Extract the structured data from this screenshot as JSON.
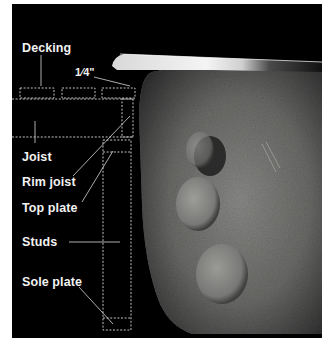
{
  "figure": {
    "type": "annotated-photo-diagram",
    "background_color": "#000000",
    "border_color": "#ffffff",
    "label_color": "#f2f2f2",
    "annotation_line_color": "#d8d8d8",
    "photo_subject": "textured stone surface with rounded dents beneath a metal blade edge"
  },
  "labels": {
    "decking": "Decking",
    "gap": "1⁄4\"",
    "joist": "Joist",
    "rim_joist": "Rim joist",
    "top_plate": "Top plate",
    "studs": "Studs",
    "sole_plate": "Sole plate"
  }
}
